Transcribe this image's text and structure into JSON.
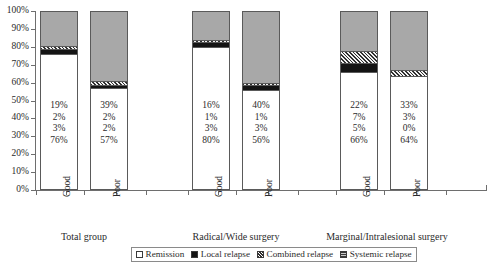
{
  "chart_data": {
    "type": "bar",
    "title": "",
    "subtitle": "",
    "xlabel": "",
    "ylabel": "",
    "ylim": [
      0,
      100
    ],
    "grid": false,
    "stacked": true,
    "stack_percent": true,
    "legend_position": "bottom",
    "y_ticks": [
      "0%",
      "10%",
      "20%",
      "30%",
      "40%",
      "50%",
      "60%",
      "70%",
      "80%",
      "90%",
      "100%"
    ],
    "y_tick_values": [
      0,
      10,
      20,
      30,
      40,
      50,
      60,
      70,
      80,
      90,
      100
    ],
    "legend": [
      {
        "label": "Remission",
        "swatch": "white-open-square"
      },
      {
        "label": "Local relapse",
        "swatch": "black-filled-square"
      },
      {
        "label": "Combined relapse",
        "swatch": "diagonal-hatched-square"
      },
      {
        "label": "Systemic relapse",
        "swatch": "horizontal-hatched-gray-square"
      }
    ],
    "series": [
      {
        "name": "Remission",
        "values": [
          76,
          57,
          80,
          56,
          66,
          64
        ]
      },
      {
        "name": "Local relapse",
        "values": [
          3,
          2,
          3,
          3,
          5,
          0
        ]
      },
      {
        "name": "Combined relapse",
        "values": [
          2,
          2,
          1,
          1,
          7,
          3
        ]
      },
      {
        "name": "Systemic relapse",
        "values": [
          19,
          39,
          16,
          40,
          22,
          33
        ]
      }
    ],
    "categories": [
      "Good",
      "Poor",
      "Good",
      "Poor",
      "Good",
      "Poor"
    ],
    "groups": [
      {
        "label": "Total group",
        "categories": [
          "Good",
          "Poor"
        ]
      },
      {
        "label": "Radical/Wide surgery",
        "categories": [
          "Good",
          "Poor"
        ]
      },
      {
        "label": "Marginal/Intralesional surgery",
        "categories": [
          "Good",
          "Poor"
        ]
      }
    ],
    "bars": [
      {
        "category": "Good",
        "group": "Total group",
        "labels": [
          "19%",
          "2%",
          "3%",
          "76%"
        ],
        "remission": 76,
        "local_relapse": 3,
        "combined_relapse": 2,
        "systemic_relapse": 19
      },
      {
        "category": "Poor",
        "group": "Total group",
        "labels": [
          "39%",
          "2%",
          "2%",
          "57%"
        ],
        "remission": 57,
        "local_relapse": 2,
        "combined_relapse": 2,
        "systemic_relapse": 39
      },
      {
        "category": "Good",
        "group": "Radical/Wide surgery",
        "labels": [
          "16%",
          "1%",
          "3%",
          "80%"
        ],
        "remission": 80,
        "local_relapse": 3,
        "combined_relapse": 1,
        "systemic_relapse": 16
      },
      {
        "category": "Poor",
        "group": "Radical/Wide surgery",
        "labels": [
          "40%",
          "1%",
          "3%",
          "56%"
        ],
        "remission": 56,
        "local_relapse": 3,
        "combined_relapse": 1,
        "systemic_relapse": 40
      },
      {
        "category": "Good",
        "group": "Marginal/Intralesional surgery",
        "labels": [
          "22%",
          "7%",
          "5%",
          "66%"
        ],
        "remission": 66,
        "local_relapse": 5,
        "combined_relapse": 7,
        "systemic_relapse": 22
      },
      {
        "category": "Poor",
        "group": "Marginal/Intralesional surgery",
        "labels": [
          "33%",
          "3%",
          "0%",
          "64%"
        ],
        "remission": 64,
        "local_relapse": 0,
        "combined_relapse": 3,
        "systemic_relapse": 33
      }
    ],
    "colors": {
      "remission": "#ffffff",
      "local_relapse": "#141414",
      "combined_relapse": "#2f2f2f",
      "systemic_relapse": "#a8a8a8",
      "axis": "#6e6e6e",
      "text": "#2b2b2b"
    }
  }
}
